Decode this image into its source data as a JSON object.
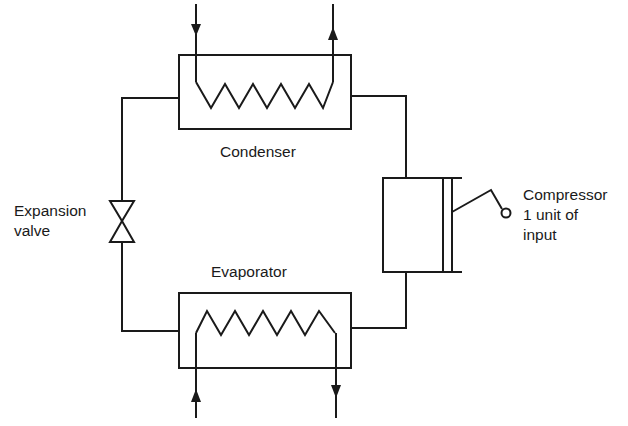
{
  "diagram": {
    "components": {
      "condenser": {
        "label": "Condenser"
      },
      "evaporator": {
        "label": "Evaporator"
      },
      "expansion_valve": {
        "label_line1": "Expansion",
        "label_line2": "valve"
      },
      "compressor": {
        "label_line1": "Compressor",
        "label_line2": "1 unit of",
        "label_line3": "input"
      }
    },
    "flows": [
      {
        "from": "condenser",
        "to": "expansion_valve"
      },
      {
        "from": "expansion_valve",
        "to": "evaporator"
      },
      {
        "from": "evaporator",
        "to": "compressor"
      },
      {
        "from": "compressor",
        "to": "condenser"
      }
    ],
    "external_streams": {
      "condenser_coil": [
        "inlet (down arrow, left)",
        "outlet (up arrow, right)"
      ],
      "evaporator_coil": [
        "inlet (up arrow, left)",
        "outlet (down arrow, right)"
      ]
    },
    "line_color": "#1a1a1a"
  }
}
